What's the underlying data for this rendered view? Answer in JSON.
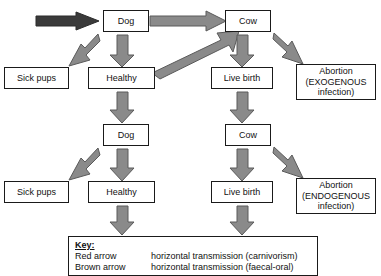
{
  "diagram": {
    "type": "flowchart",
    "colors": {
      "dark_arrow": "#3a3a3a",
      "grey_arrow": "#808080",
      "arrow_outline": "#555555",
      "box_border": "#1a1a1a",
      "background": "#ffffff",
      "text": "#111111"
    },
    "nodes": [
      {
        "id": "dog-top",
        "label": "Dog",
        "row": 1
      },
      {
        "id": "cow-top",
        "label": "Cow",
        "row": 1
      },
      {
        "id": "sick-pups-top",
        "label": "Sick pups",
        "row": 2
      },
      {
        "id": "healthy-top",
        "label": "Healthy",
        "row": 2
      },
      {
        "id": "live-birth-top",
        "label": "Live birth",
        "row": 2
      },
      {
        "id": "abortion-exo",
        "label": "Abortion\n(EXOGENOUS\ninfection)",
        "row": 2
      },
      {
        "id": "dog-mid",
        "label": "Dog",
        "row": 3
      },
      {
        "id": "cow-mid",
        "label": "Cow",
        "row": 3
      },
      {
        "id": "sick-pups-bot",
        "label": "Sick pups",
        "row": 4
      },
      {
        "id": "healthy-bot",
        "label": "Healthy",
        "row": 4
      },
      {
        "id": "live-birth-bot",
        "label": "Live birth",
        "row": 4
      },
      {
        "id": "abortion-endo",
        "label": "Abortion\n(ENDOGENOUS\ninfection)",
        "row": 4
      }
    ],
    "arrows": [
      {
        "id": "inbound-to-dog",
        "color": "dark",
        "direction": "right",
        "from": "external",
        "to": "dog-top"
      },
      {
        "id": "dog-top-to-cow-top",
        "color": "grey",
        "direction": "right",
        "from": "dog-top",
        "to": "cow-top"
      },
      {
        "id": "dog-top-to-sick-pups",
        "color": "grey",
        "direction": "down-left",
        "from": "dog-top",
        "to": "sick-pups-top"
      },
      {
        "id": "dog-top-to-healthy",
        "color": "grey",
        "direction": "down",
        "from": "dog-top",
        "to": "healthy-top"
      },
      {
        "id": "healthy-top-to-cow-top",
        "color": "grey",
        "direction": "up-right",
        "from": "healthy-top",
        "to": "cow-top"
      },
      {
        "id": "cow-top-to-live-birth",
        "color": "grey",
        "direction": "down",
        "from": "cow-top",
        "to": "live-birth-top"
      },
      {
        "id": "cow-top-to-abortion-exo",
        "color": "grey",
        "direction": "down-right",
        "from": "cow-top",
        "to": "abortion-exo"
      },
      {
        "id": "healthy-top-to-dog-mid",
        "color": "grey",
        "direction": "down",
        "from": "healthy-top",
        "to": "dog-mid"
      },
      {
        "id": "live-birth-to-cow-mid",
        "color": "grey",
        "direction": "down",
        "from": "live-birth-top",
        "to": "cow-mid"
      },
      {
        "id": "dog-mid-to-sick-pups",
        "color": "grey",
        "direction": "down-left",
        "from": "dog-mid",
        "to": "sick-pups-bot"
      },
      {
        "id": "dog-mid-to-healthy",
        "color": "grey",
        "direction": "down",
        "from": "dog-mid",
        "to": "healthy-bot"
      },
      {
        "id": "cow-mid-to-live-birth",
        "color": "grey",
        "direction": "down",
        "from": "cow-mid",
        "to": "live-birth-bot"
      },
      {
        "id": "cow-mid-to-abortion-endo",
        "color": "grey",
        "direction": "down-right",
        "from": "cow-mid",
        "to": "abortion-endo"
      },
      {
        "id": "healthy-bot-downward",
        "color": "grey",
        "direction": "down",
        "from": "healthy-bot",
        "to": "below"
      },
      {
        "id": "live-birth-bot-downward",
        "color": "grey",
        "direction": "down",
        "from": "live-birth-bot",
        "to": "below"
      }
    ]
  },
  "key": {
    "title": "Key:",
    "rows": [
      {
        "term": "Red arrow",
        "description": "horizontal transmission (carnivorism)"
      },
      {
        "term": "Brown arrow",
        "description": "horizontal transmission (faecal-oral)"
      }
    ]
  }
}
